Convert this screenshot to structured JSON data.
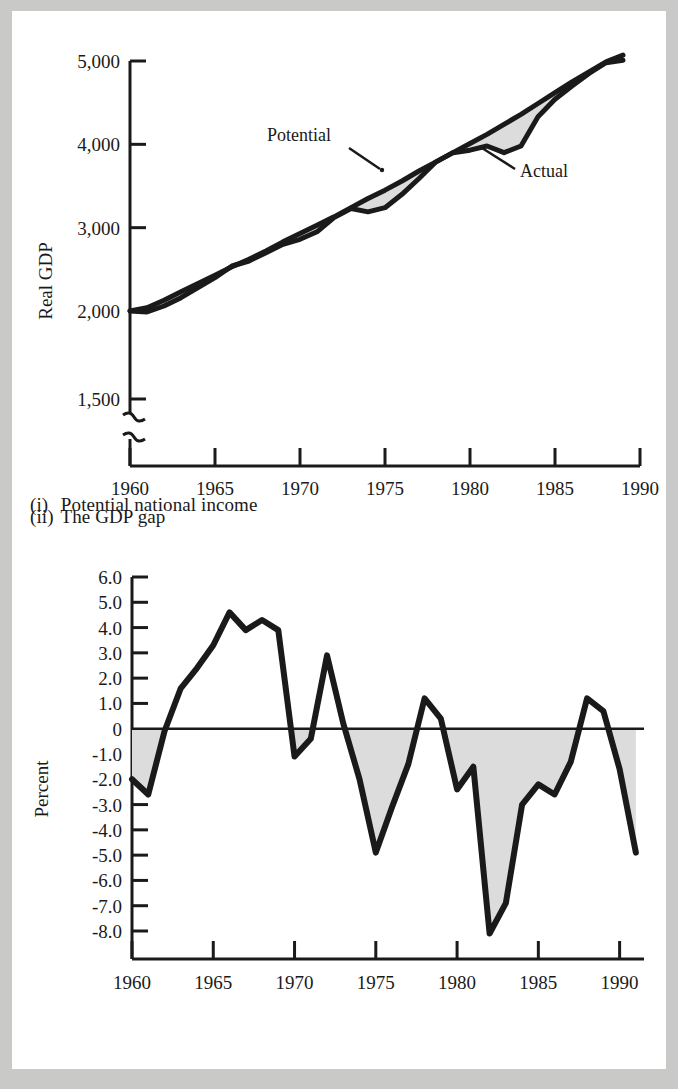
{
  "figure": {
    "background_color": "#c9c9c7",
    "paper_color": "#ffffff",
    "line_color": "#1a1a1a",
    "fill_color": "#dcdcdc"
  },
  "panels": [
    {
      "id": "potential-national-income",
      "caption_numeral": "(i)",
      "caption_text": "Potential national income"
    },
    {
      "id": "gdp-gap",
      "caption_numeral": "(ii)",
      "caption_text": "The GDP gap"
    }
  ],
  "chart_data": [
    {
      "type": "line",
      "id": "potential-national-income",
      "title": "",
      "xlabel": "",
      "ylabel": "Real GDP",
      "xlim": [
        1960,
        1990
      ],
      "xticks": [
        1960,
        1965,
        1970,
        1975,
        1980,
        1985,
        1990
      ],
      "xticklabels": [
        "1960",
        "1965",
        "1970",
        "1975",
        "1980",
        "1985",
        "1990"
      ],
      "yticks": [
        1500,
        2000,
        3000,
        4000,
        5000
      ],
      "yticklabels": [
        "1,500",
        "2,000",
        "3,000",
        "4,000",
        "5,000"
      ],
      "ylim": [
        1500,
        5100
      ],
      "axis_break": true,
      "axis_break_note": "scale break below 1,500",
      "grid": false,
      "legend": "annotations",
      "annotations": [
        {
          "label": "Potential",
          "points_to": "upper-line",
          "x": 1975
        },
        {
          "label": "Actual",
          "points_to": "lower-line",
          "x": 1982
        }
      ],
      "x": [
        1960,
        1961,
        1962,
        1963,
        1964,
        1965,
        1966,
        1967,
        1968,
        1969,
        1970,
        1971,
        1972,
        1973,
        1974,
        1975,
        1976,
        1977,
        1978,
        1979,
        1980,
        1981,
        1982,
        1983,
        1984,
        1985,
        1986,
        1987,
        1988,
        1989
      ],
      "series": [
        {
          "name": "Potential",
          "values": [
            2000,
            2040,
            2130,
            2230,
            2330,
            2430,
            2530,
            2620,
            2720,
            2830,
            2930,
            3030,
            3130,
            3240,
            3350,
            3450,
            3560,
            3680,
            3790,
            3900,
            4010,
            4120,
            4240,
            4360,
            4490,
            4620,
            4750,
            4870,
            4990,
            5070
          ]
        },
        {
          "name": "Actual",
          "values": [
            2000,
            1995,
            2060,
            2160,
            2280,
            2400,
            2540,
            2600,
            2700,
            2800,
            2860,
            2950,
            3120,
            3230,
            3190,
            3240,
            3400,
            3590,
            3790,
            3900,
            3930,
            3980,
            3900,
            3980,
            4330,
            4540,
            4700,
            4850,
            4980,
            5010
          ]
        }
      ],
      "shaded_region": "between Potential and Actual where Actual < Potential"
    },
    {
      "type": "line",
      "id": "gdp-gap",
      "title": "",
      "xlabel": "",
      "ylabel": "Percent",
      "xlim": [
        1960,
        1991.5
      ],
      "xticks": [
        1960,
        1965,
        1970,
        1975,
        1980,
        1985,
        1990
      ],
      "xticklabels": [
        "1960",
        "1965",
        "1970",
        "1975",
        "1980",
        "1985",
        "1990"
      ],
      "yticks": [
        6,
        5,
        4,
        3,
        2,
        1,
        0,
        -1,
        -2,
        -3,
        -4,
        -5,
        -6,
        -7,
        -8
      ],
      "yticklabels": [
        "6.0",
        "5.0",
        "4.0",
        "3.0",
        "2.0",
        "1.0",
        "0",
        "-1.0",
        "-2.0",
        "-3.0",
        "-4.0",
        "-5.0",
        "-6.0",
        "-7.0",
        "-8.0"
      ],
      "ylim": [
        -8.6,
        6.2
      ],
      "zero_line": 0,
      "grid": false,
      "x": [
        1960,
        1961,
        1962,
        1963,
        1964,
        1965,
        1966,
        1967,
        1968,
        1969,
        1970,
        1971,
        1972,
        1973,
        1974,
        1975,
        1976,
        1977,
        1978,
        1979,
        1980,
        1981,
        1982,
        1983,
        1984,
        1985,
        1986,
        1987,
        1988,
        1989,
        1990,
        1991
      ],
      "values": [
        -2.0,
        -2.6,
        -0.1,
        1.6,
        2.4,
        3.3,
        4.6,
        3.9,
        4.3,
        3.9,
        -1.1,
        -0.4,
        2.9,
        0.2,
        -2.0,
        -4.9,
        -3.1,
        -1.4,
        1.2,
        0.4,
        -2.4,
        -1.5,
        -8.1,
        -6.9,
        -3.0,
        -2.2,
        -2.6,
        -1.3,
        1.2,
        0.7,
        -1.6,
        -4.9
      ],
      "shaded_region": "between curve and zero line where value < 0"
    }
  ]
}
